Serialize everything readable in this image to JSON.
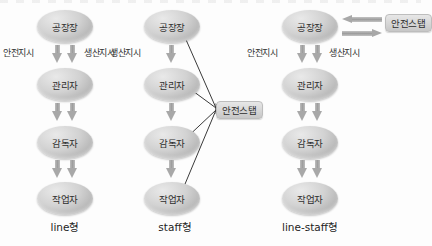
{
  "diagram": {
    "title_fragment": "",
    "colors": {
      "node_fill": "#c9c9c9",
      "staff_fill": "#d6d6d6",
      "arrow_gray": "#a8a8a8",
      "line_stroke": "#3a3a3a",
      "text": "#2e2e2e",
      "background": "#fdfdfd"
    },
    "roles": {
      "plant_manager": "공장장",
      "manager": "관리자",
      "supervisor": "감독자",
      "worker": "작업자",
      "safety_staff": "안전스탭"
    },
    "flow_labels": {
      "safety_order": "안전지시",
      "production_order": "생산지시"
    },
    "columns": [
      {
        "id": "line",
        "caption": "line형",
        "nodes": [
          "공장장",
          "관리자",
          "감독자",
          "작업자"
        ],
        "top_labels": [
          "안전지시",
          "생산지시"
        ],
        "arrows_per_gap": 2,
        "has_safety_staff": false,
        "staff_link": "none"
      },
      {
        "id": "staff",
        "caption": "staff형",
        "nodes": [
          "공장장",
          "관리자",
          "감독자",
          "작업자"
        ],
        "top_labels": [
          "생산지시"
        ],
        "arrows_per_gap": 1,
        "has_safety_staff": true,
        "staff_label": "안전스탭",
        "staff_link": "fan-bidirectional-to-all-four-nodes"
      },
      {
        "id": "line-staff",
        "caption": "line-staff형",
        "nodes": [
          "공장장",
          "관리자",
          "감독자",
          "작업자"
        ],
        "top_labels": [
          "안전지시",
          "생산지시"
        ],
        "arrows_per_gap": 2,
        "has_safety_staff": true,
        "staff_label": "안전스탭",
        "staff_link": "bidirectional-horizontal-to-plant-manager"
      }
    ]
  }
}
